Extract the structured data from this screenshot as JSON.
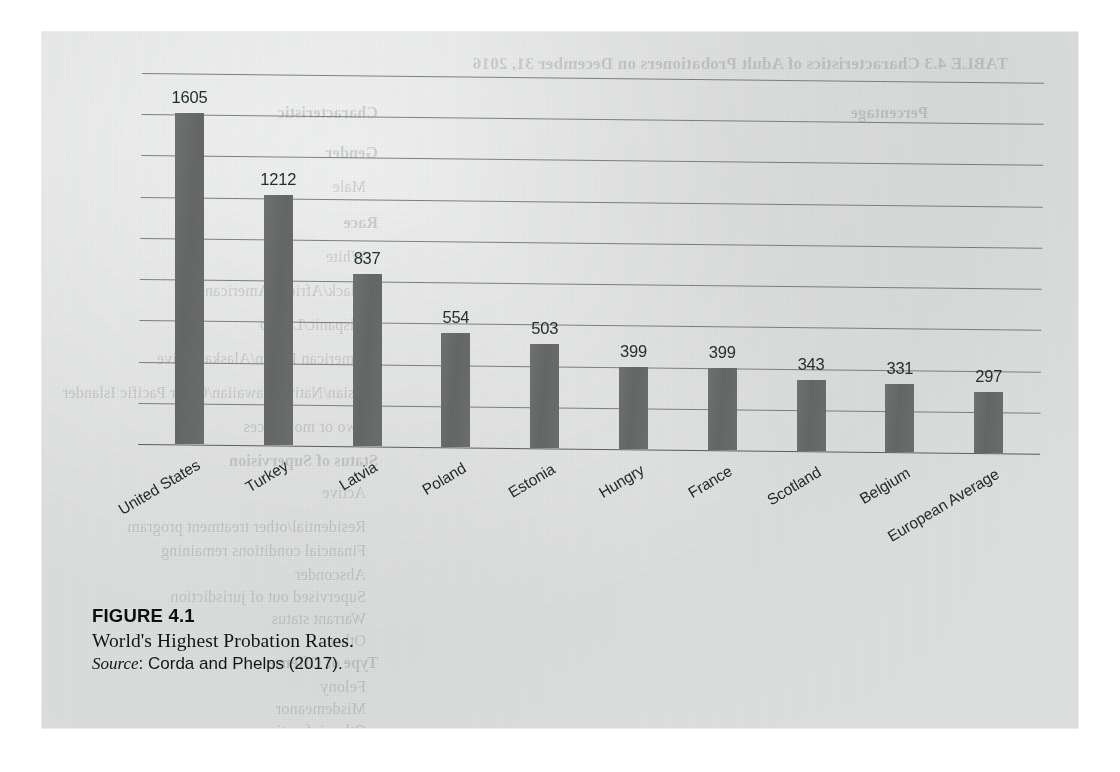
{
  "figure": {
    "number_label": "FIGURE 4.1",
    "title": "World's Highest Probation Rates.",
    "source_prefix": "Source",
    "source_text": ": Corda and Phelps (2017)."
  },
  "colors": {
    "bar_fill": "#666a69",
    "gridline": "#6b6d6c",
    "axis": "#545756",
    "page_background": "#e1e3e2",
    "text": "#1a1e1d"
  },
  "chart_data": {
    "type": "bar",
    "title": "World's Highest Probation Rates.",
    "xlabel": "",
    "ylabel": "",
    "ylim": [
      0,
      1800
    ],
    "grid": true,
    "gridline_interval": 200,
    "legend": null,
    "value_labels_shown": true,
    "categories": [
      "United States",
      "Turkey",
      "Latvia",
      "Poland",
      "Estonia",
      "Hungry",
      "France",
      "Scotland",
      "Belgium",
      "European Average"
    ],
    "values": [
      1605,
      1212,
      837,
      554,
      503,
      399,
      399,
      343,
      331,
      297
    ],
    "value_label_text": [
      "1605",
      "1212",
      "837",
      "554",
      "503",
      "399",
      "399",
      "343",
      "331",
      "297"
    ]
  },
  "bleed_through": {
    "note": "faint mirrored show-through text from reverse page",
    "lines": [
      "TABLE 4.3  Characteristics of Adult Probationers on December 31, 2016",
      "Characteristic",
      "Percentage",
      "Gender",
      "Male",
      "Race",
      "White",
      "Black/African American",
      "Hispanic/Latino",
      "American Indian/Alaska Native",
      "Asian/Native Hawaiian/Other Pacific Islander",
      "Two or more races",
      "Status of Supervision",
      "Active",
      "Residential/other treatment program",
      "Financial conditions remaining",
      "Absconder",
      "Supervised out of jurisdiction",
      "Warrant status",
      "Other",
      "Type of Offense",
      "Felony",
      "Misdemeanor",
      "Other infractions"
    ]
  }
}
